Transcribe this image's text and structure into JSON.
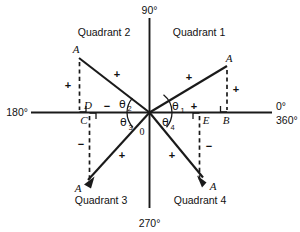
{
  "figure": {
    "axis_labels": {
      "top": "90°",
      "bottom": "270°",
      "left": "180°",
      "right_zero": "0°",
      "right_full": "360°"
    },
    "origin_label": "0",
    "quadrants": [
      {
        "id": "q1",
        "label": "Quadrant 1",
        "angle_label": "θ",
        "angle_subscript": "1",
        "vertex_label": "A",
        "foot_label": "B",
        "inner_foot_label": "E"
      },
      {
        "id": "q2",
        "label": "Quadrant 2",
        "angle_label": "θ",
        "angle_subscript": "2",
        "vertex_label": "A",
        "foot_label": "D",
        "inner_foot_label": "C"
      },
      {
        "id": "q3",
        "label": "Quadrant 3",
        "angle_label": "θ",
        "angle_subscript": "3",
        "vertex_label": "A",
        "foot_label": "C",
        "inner_foot_label": "C"
      },
      {
        "id": "q4",
        "label": "Quadrant 4",
        "angle_label": "θ",
        "angle_subscript": "4",
        "vertex_label": "A",
        "foot_label": "E",
        "inner_foot_label": "E"
      }
    ],
    "signs": {
      "q1_hypotenuse": "+",
      "q1_vertical": "+",
      "q1_horizontal": "+",
      "q2_hypotenuse": "+",
      "q2_vertical": "+",
      "q2_horizontal": "−",
      "q3_hypotenuse": "+",
      "q3_vertical": "−",
      "q4_hypotenuse": "+",
      "q4_vertical": "−"
    },
    "colors": {
      "ink": "#1a1a1a",
      "background": "#ffffff"
    }
  }
}
